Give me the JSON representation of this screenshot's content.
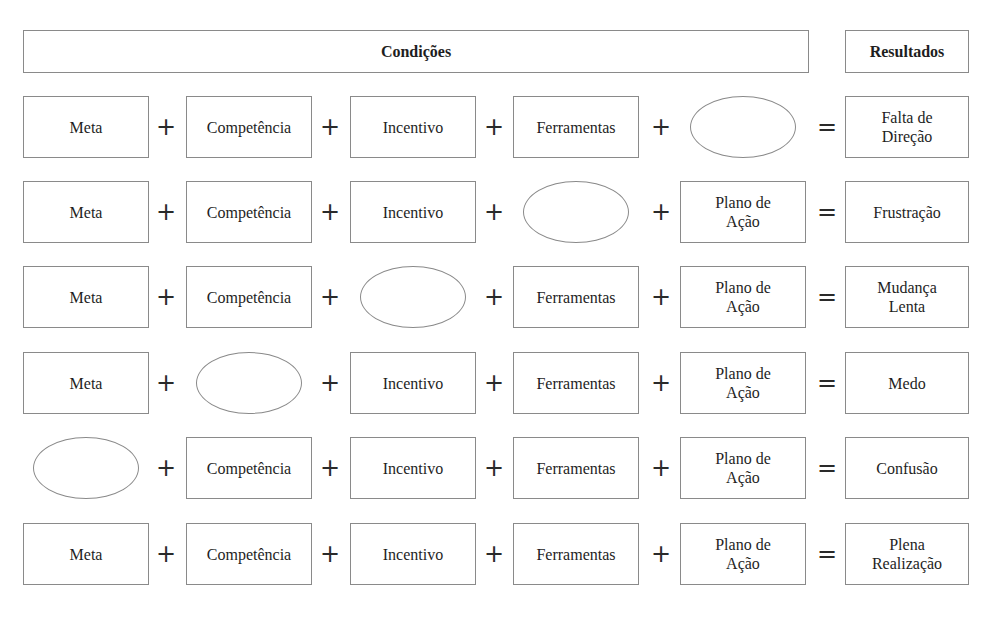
{
  "header": {
    "conditions_label": "Condições",
    "results_label": "Resultados"
  },
  "operators": {
    "plus": "+",
    "equals": "="
  },
  "columns": [
    "Meta",
    "Competência",
    "Incentivo",
    "Ferramentas",
    "Plano de Ação"
  ],
  "rows": [
    {
      "cells": [
        "Meta",
        "Competência",
        "Incentivo",
        "Ferramentas",
        ""
      ],
      "missing_index": 4,
      "result": "Falta de Direção"
    },
    {
      "cells": [
        "Meta",
        "Competência",
        "Incentivo",
        "",
        "Plano de Ação"
      ],
      "missing_index": 3,
      "result": "Frustração"
    },
    {
      "cells": [
        "Meta",
        "Competência",
        "",
        "Ferramentas",
        "Plano de Ação"
      ],
      "missing_index": 2,
      "result": "Mudança Lenta"
    },
    {
      "cells": [
        "Meta",
        "",
        "Incentivo",
        "Ferramentas",
        "Plano de Ação"
      ],
      "missing_index": 1,
      "result": "Medo"
    },
    {
      "cells": [
        "",
        "Competência",
        "Incentivo",
        "Ferramentas",
        "Plano de Ação"
      ],
      "missing_index": 0,
      "result": "Confusão"
    },
    {
      "cells": [
        "Meta",
        "Competência",
        "Incentivo",
        "Ferramentas",
        "Plano de Ação"
      ],
      "missing_index": null,
      "result": "Plena Realização"
    }
  ],
  "display": {
    "plano_line1": "Plano de",
    "plano_line2": "Ação",
    "results_lines": [
      [
        "Falta de",
        "Direção"
      ],
      [
        "Frustração"
      ],
      [
        "Mudança",
        "Lenta"
      ],
      [
        "Medo"
      ],
      [
        "Confusão"
      ],
      [
        "Plena",
        "Realização"
      ]
    ]
  }
}
